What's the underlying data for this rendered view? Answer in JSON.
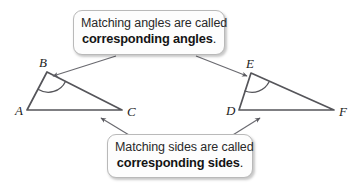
{
  "figure": {
    "background_color": "#ffffff",
    "stroke_color": "#55555a",
    "label_color": "#1c1c1c"
  },
  "callouts": [
    {
      "id": "angles",
      "line1": "Matching angles are called",
      "line2": "corresponding angles",
      "period": ".",
      "points_to": [
        "B",
        "E"
      ]
    },
    {
      "id": "sides",
      "line1": "Matching sides are called",
      "line2": "corresponding sides",
      "period": ".",
      "points_to": [
        "AC",
        "DF"
      ]
    }
  ],
  "triangles": [
    {
      "name": "ABC",
      "vertices": [
        {
          "label": "A",
          "x": 27,
          "y": 110,
          "label_x": 15,
          "label_y": 115
        },
        {
          "label": "B",
          "x": 47,
          "y": 72,
          "label_x": 39,
          "label_y": 67
        },
        {
          "label": "C",
          "x": 122,
          "y": 110,
          "label_x": 127,
          "label_y": 116
        }
      ],
      "marked_angle": "B"
    },
    {
      "name": "DEF",
      "vertices": [
        {
          "label": "D",
          "x": 239,
          "y": 110,
          "label_x": 226,
          "label_y": 115
        },
        {
          "label": "E",
          "x": 251,
          "y": 73,
          "label_x": 246,
          "label_y": 68
        },
        {
          "label": "F",
          "x": 334,
          "y": 110,
          "label_x": 339,
          "label_y": 116
        }
      ],
      "marked_angle": "E"
    }
  ],
  "arrows": [
    {
      "name": "arrow-to-angle-B",
      "from_x": 116,
      "from_y": 56,
      "to_x": 51,
      "to_y": 77
    },
    {
      "name": "arrow-to-angle-E",
      "from_x": 196,
      "from_y": 56,
      "to_x": 249,
      "to_y": 77
    },
    {
      "name": "arrow-to-side-AC",
      "from_x": 134,
      "from_y": 138,
      "to_x": 99,
      "to_y": 117
    },
    {
      "name": "arrow-to-side-DF",
      "from_x": 228,
      "from_y": 138,
      "to_x": 262,
      "to_y": 117
    }
  ]
}
